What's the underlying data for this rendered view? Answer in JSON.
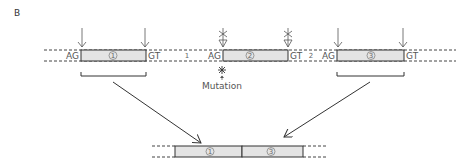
{
  "panel_label": "B",
  "colors": {
    "exon_fill": "#e4e4e4",
    "line": "#333333",
    "dashed": "#444444",
    "text": "#555555"
  },
  "top_row": {
    "exons": [
      {
        "number": "1",
        "left_site": "AG",
        "right_site": "GT"
      },
      {
        "number": "2",
        "left_site": "AG",
        "right_site": "GT",
        "mutated_sites": true
      },
      {
        "number": "3",
        "left_site": "AG",
        "right_site": "GT"
      }
    ],
    "introns": [
      {
        "number": "1"
      },
      {
        "number": "2"
      }
    ],
    "mutation_label": "Mutation"
  },
  "bottom_row": {
    "exons": [
      {
        "number": "1"
      },
      {
        "number": "3"
      }
    ]
  }
}
